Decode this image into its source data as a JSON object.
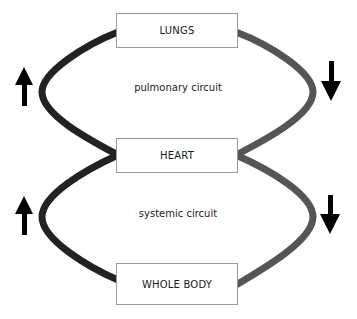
{
  "nodes": {
    "lungs": "LUNGS",
    "heart": "HEART",
    "body": "WHOLE BODY"
  },
  "circuits": {
    "pulmonary": "pulmonary circuit",
    "systemic": "systemic circuit"
  },
  "colors": {
    "left_vessel": "#222222",
    "right_vessel": "#555555",
    "arrow": "#000000",
    "box_border": "#9a9a9a"
  },
  "arrows": {
    "left": "up",
    "right": "down"
  }
}
